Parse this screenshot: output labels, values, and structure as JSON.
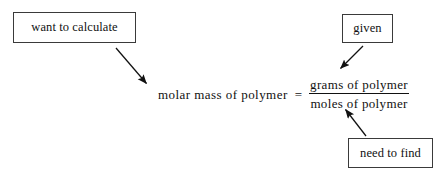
{
  "diagram": {
    "background_color": "#ffffff",
    "ink_color": "#111111",
    "border_color": "#3a3a3a",
    "boxes": [
      {
        "id": "want-to-calculate",
        "label": "want to calculate"
      },
      {
        "id": "given",
        "label": "given"
      },
      {
        "id": "need-to-find",
        "label": "need to find"
      }
    ],
    "equation": {
      "left_side": "molar mass of polymer",
      "operator": "=",
      "numerator": "grams of polymer",
      "denominator": "moles of polymer"
    },
    "arrows": [
      {
        "id": "arrow-want-to-calculate",
        "from_box": "want to calculate",
        "to_target": "molar mass of polymer",
        "direction": "down-right"
      },
      {
        "id": "arrow-given",
        "from_box": "given",
        "to_target": "grams of polymer",
        "direction": "down-left"
      },
      {
        "id": "arrow-need-to-find",
        "from_box": "need to find",
        "to_target": "moles of polymer",
        "direction": "up-left"
      }
    ]
  }
}
